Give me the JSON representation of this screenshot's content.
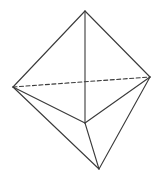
{
  "diagram": {
    "title": "",
    "type": "polyhedron-wireframe",
    "stroke_color": "#3a3a3a",
    "background": "#ffffff",
    "vertices": {
      "top": [
        85,
        11
      ],
      "left": [
        13,
        87
      ],
      "right": [
        150,
        77
      ],
      "middle": [
        85,
        123
      ],
      "bottom": [
        99,
        169
      ]
    },
    "edges": [
      {
        "from": "top",
        "to": "left",
        "style": "solid"
      },
      {
        "from": "top",
        "to": "right",
        "style": "solid"
      },
      {
        "from": "top",
        "to": "middle",
        "style": "solid"
      },
      {
        "from": "left",
        "to": "right",
        "style": "dashed"
      },
      {
        "from": "left",
        "to": "middle",
        "style": "solid"
      },
      {
        "from": "right",
        "to": "middle",
        "style": "solid"
      },
      {
        "from": "left",
        "to": "bottom",
        "style": "solid"
      },
      {
        "from": "middle",
        "to": "bottom",
        "style": "solid"
      },
      {
        "from": "right",
        "to": "bottom",
        "style": "solid"
      }
    ]
  }
}
